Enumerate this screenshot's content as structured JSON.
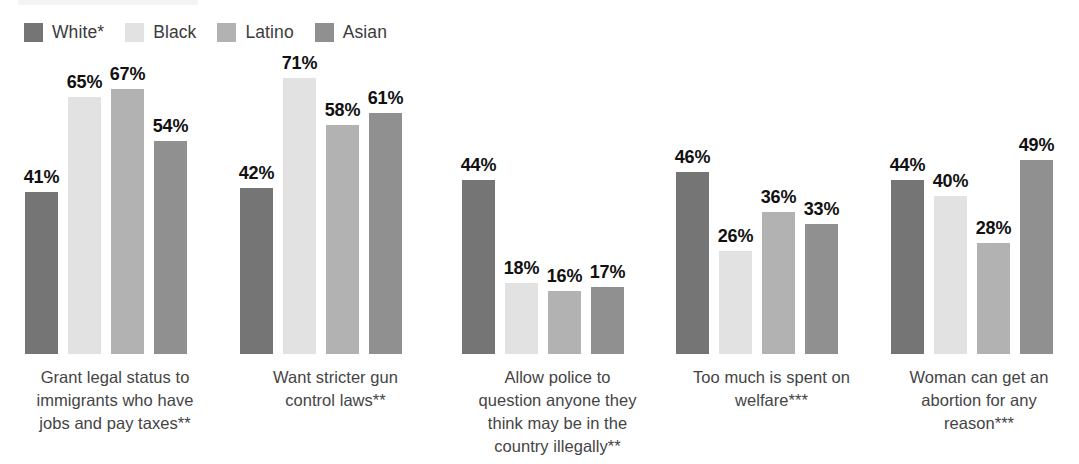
{
  "legend": {
    "items": [
      {
        "label": "White*",
        "color": "#757575",
        "name": "legend-item-white"
      },
      {
        "label": "Black",
        "color": "#e2e2e2",
        "name": "legend-item-black"
      },
      {
        "label": "Latino",
        "color": "#b2b2b2",
        "name": "legend-item-latino"
      },
      {
        "label": "Asian",
        "color": "#909090",
        "name": "legend-item-asian"
      }
    ]
  },
  "chart_data": {
    "type": "bar",
    "title": "",
    "subtitle": "",
    "xlabel": "",
    "ylabel": "",
    "ylim": [
      0,
      80
    ],
    "grid": false,
    "legend_position": "top-left",
    "value_suffix": "%",
    "categories": [
      "Grant legal status to immigrants who have jobs and pay taxes**",
      "Want stricter gun control laws**",
      "Allow police to question anyone they think may be in the country illegally**",
      "Too much is spent on welfare***",
      "Woman can get an abortion for any reason***"
    ],
    "category_lines": [
      [
        "Grant legal status to",
        "immigrants who have",
        "jobs and pay taxes**"
      ],
      [
        "Want stricter gun",
        "control laws**"
      ],
      [
        "Allow police to",
        "question anyone they",
        "think may be in the",
        "country illegally**"
      ],
      [
        "Too much is spent on",
        "welfare***"
      ],
      [
        "Woman can get an",
        "abortion for any",
        "reason***"
      ]
    ],
    "series": [
      {
        "name": "White*",
        "color": "#757575",
        "values": [
          41,
          42,
          44,
          46,
          44
        ]
      },
      {
        "name": "Black",
        "color": "#e2e2e2",
        "values": [
          65,
          71,
          18,
          26,
          40
        ]
      },
      {
        "name": "Latino",
        "color": "#b2b2b2",
        "values": [
          67,
          58,
          16,
          36,
          28
        ]
      },
      {
        "name": "Asian",
        "color": "#909090",
        "values": [
          54,
          61,
          17,
          33,
          49
        ]
      }
    ],
    "value_labels": [
      [
        "41%",
        "65%",
        "67%",
        "54%"
      ],
      [
        "42%",
        "71%",
        "58%",
        "61%"
      ],
      [
        "44%",
        "18%",
        "16%",
        "17%"
      ],
      [
        "46%",
        "26%",
        "36%",
        "33%"
      ],
      [
        "44%",
        "40%",
        "28%",
        "49%"
      ]
    ]
  },
  "layout": {
    "group_left": [
      25,
      240,
      462,
      676,
      891
    ],
    "caption_left": [
      0,
      228,
      450,
      664,
      879
    ],
    "caption_width": [
      230,
      215,
      215,
      215,
      200
    ],
    "bar_width": 33,
    "bar_gap": 10,
    "plot_height": 300,
    "px_per_unit": 3.95
  }
}
